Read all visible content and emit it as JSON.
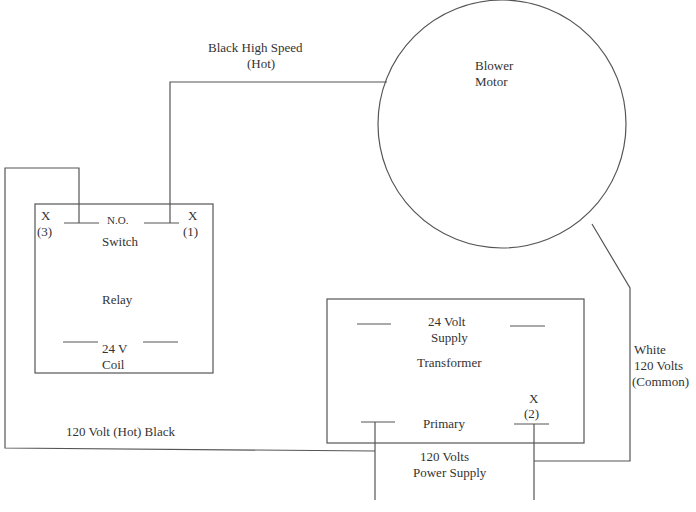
{
  "diagram": {
    "type": "wiring-diagram",
    "components": {
      "blower_motor": {
        "line1": "Blower",
        "line2": "Motor"
      },
      "relay": {
        "title": "Relay",
        "switch_label": "N.O.",
        "switch_name": "Switch",
        "coil_line1": "24 V",
        "coil_line2": "Coil",
        "terminal_left": {
          "mark": "X",
          "number": "(3)"
        },
        "terminal_right": {
          "mark": "X",
          "number": "(1)"
        }
      },
      "transformer": {
        "title": "Transformer",
        "secondary_line1": "24 Volt",
        "secondary_line2": "Supply",
        "primary": "Primary",
        "terminal": {
          "mark": "X",
          "number": "(2)"
        }
      }
    },
    "wires": {
      "high_speed_line1": "Black  High Speed",
      "high_speed_line2": "(Hot)",
      "hot_black": "120 Volt (Hot)  Black",
      "common_line1": "White",
      "common_line2": "120 Volts",
      "common_line3": "(Common)",
      "power_supply_line1": "120 Volts",
      "power_supply_line2": "Power Supply"
    },
    "colors": {
      "line": "#555555",
      "background": "#ffffff"
    }
  }
}
